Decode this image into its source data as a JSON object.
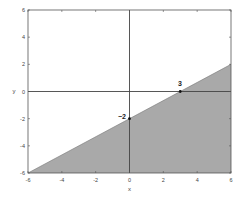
{
  "chart_data": {
    "type": "area",
    "title": "",
    "xlabel": "x",
    "ylabel": "y",
    "xlim": [
      -6,
      6
    ],
    "ylim": [
      -6,
      6
    ],
    "xticks": [
      -6,
      -4,
      -2,
      0,
      2,
      4,
      6
    ],
    "yticks": [
      -6,
      -4,
      -2,
      0,
      2,
      4,
      6
    ],
    "xtick_labels": [
      "-6",
      "-4",
      "-2",
      "0",
      "2",
      "4",
      "6"
    ],
    "ytick_labels": [
      "-6",
      "-4",
      "-2",
      "0",
      "2",
      "4",
      "6"
    ],
    "grid": false,
    "legend": null,
    "series": [
      {
        "name": "boundary line y = (2/3)x - 2",
        "x": [
          -6,
          6
        ],
        "y": [
          -6,
          2
        ]
      }
    ],
    "shaded_region": {
      "description": "region below the line y = (2/3)x - 2",
      "color": "#a9a9a9",
      "polygon": [
        [
          -6,
          -6
        ],
        [
          6,
          2
        ],
        [
          6,
          -6
        ]
      ]
    },
    "annotations": [
      {
        "text": "3",
        "x": 3,
        "y": 0,
        "note": "x-intercept"
      },
      {
        "text": "-2",
        "x": 0,
        "y": -2,
        "note": "y-intercept"
      }
    ],
    "axis_lines": {
      "x_axis_at": 0,
      "y_axis_at": 0
    }
  },
  "labels": {
    "xlabel": "x",
    "ylabel": "y",
    "x_intercept": "3",
    "y_intercept": "−2"
  },
  "colors": {
    "fill": "#a9a9a9",
    "axes": "#555555",
    "text": "#333333",
    "background": "#ffffff"
  }
}
